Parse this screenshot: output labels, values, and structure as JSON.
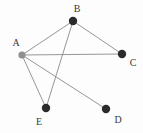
{
  "figure": {
    "kind": "undirected-graph-diagram",
    "width": 143,
    "height": 133,
    "background_color": "#fdfdfd",
    "edge_color": "#8a8a8a",
    "edge_width": 0.9,
    "default_node_color": "#2b2b2b",
    "highlight_node_color": "#8f8f8f",
    "label_color": "#3a3a3a"
  },
  "chart_data": {
    "type": "diagram",
    "title": "",
    "nodes": [
      {
        "id": "A",
        "label": "A",
        "x": 22,
        "y": 55,
        "r": 3.6,
        "color": "#8f8f8f",
        "label_x": 16,
        "label_y": 43
      },
      {
        "id": "B",
        "label": "B",
        "x": 73,
        "y": 21,
        "r": 4.2,
        "color": "#2b2b2b",
        "label_x": 77,
        "label_y": 9
      },
      {
        "id": "C",
        "label": "C",
        "x": 122,
        "y": 54,
        "r": 4.2,
        "color": "#2b2b2b",
        "label_x": 133,
        "label_y": 63
      },
      {
        "id": "D",
        "label": "D",
        "x": 106,
        "y": 109,
        "r": 4.2,
        "color": "#2b2b2b",
        "label_x": 118,
        "label_y": 120
      },
      {
        "id": "E",
        "label": "E",
        "x": 46,
        "y": 108,
        "r": 4.2,
        "color": "#2b2b2b",
        "label_x": 39,
        "label_y": 122
      }
    ],
    "edges": [
      {
        "source": "A",
        "target": "B"
      },
      {
        "source": "A",
        "target": "C"
      },
      {
        "source": "A",
        "target": "D"
      },
      {
        "source": "A",
        "target": "E"
      },
      {
        "source": "B",
        "target": "C"
      },
      {
        "source": "B",
        "target": "E"
      }
    ]
  }
}
